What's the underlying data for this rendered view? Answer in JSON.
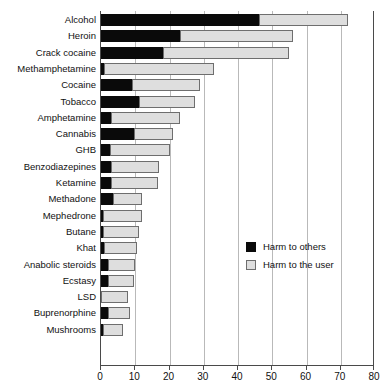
{
  "chart_data": {
    "type": "bar",
    "orientation": "horizontal",
    "stacked": true,
    "title": "",
    "subtitle": "",
    "xlabel": "",
    "ylabel": "",
    "xlim": [
      0,
      80
    ],
    "ylim": null,
    "xticks": [
      0,
      10,
      20,
      30,
      40,
      50,
      60,
      70,
      80
    ],
    "xticklabels": [
      "0",
      "10",
      "20",
      "30",
      "40",
      "50",
      "60",
      "70",
      "80"
    ],
    "grid": "vertical",
    "legend_position": "center-right",
    "categories": [
      "Alcohol",
      "Heroin",
      "Crack cocaine",
      "Methamphetamine",
      "Cocaine",
      "Tobacco",
      "Amphetamine",
      "Cannabis",
      "GHB",
      "Benzodiazepines",
      "Ketamine",
      "Methadone",
      "Mephedrone",
      "Butane",
      "Khat",
      "Anabolic steroids",
      "Ecstasy",
      "LSD",
      "Buprenorphine",
      "Mushrooms"
    ],
    "series": [
      {
        "name": "Harm to others",
        "color": "#0a0a0a",
        "values": [
          46,
          23,
          18,
          1,
          9,
          11,
          3,
          9.5,
          2.5,
          3,
          3,
          3.5,
          0.5,
          0.5,
          1,
          2,
          2,
          0,
          2,
          0.5
        ]
      },
      {
        "name": "Harm to the user",
        "color": "#dedede",
        "values": [
          26,
          33,
          37,
          32,
          20,
          16.5,
          20,
          11.5,
          17.5,
          14,
          13.5,
          8.5,
          11.5,
          10.5,
          9.5,
          8,
          7.5,
          8,
          6.5,
          6
        ]
      }
    ],
    "totals": [
      72,
      56,
      55,
      33,
      29,
      27.5,
      23,
      21,
      20,
      17,
      16.5,
      12,
      12,
      11,
      10.5,
      10,
      9.5,
      8,
      8.5,
      6.5
    ]
  },
  "legend": {
    "items": [
      {
        "label": "Harm to others",
        "swatch": "black-square"
      },
      {
        "label": "Harm to the user",
        "swatch": "light-gray-square"
      }
    ]
  },
  "colors": {
    "harm_to_others": "#0a0a0a",
    "harm_to_user": "#dedede",
    "axis": "#4a4a4a",
    "grid": "#b9b9b9",
    "background": "#ffffff",
    "text": "#111111"
  }
}
